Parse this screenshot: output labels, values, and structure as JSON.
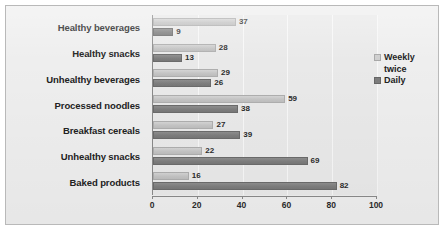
{
  "chart_data": {
    "type": "bar",
    "orientation": "horizontal",
    "title": "",
    "subtitle": "",
    "xlabel": "",
    "ylabel": "",
    "categories": [
      "Healthy beverages",
      "Healthy snacks",
      "Unhealthy beverages",
      "Processed noodles",
      "Breakfast cereals",
      "Unhealthy snacks",
      "Baked products"
    ],
    "series": [
      {
        "name": "Weekly twice",
        "color": "#c6c6c6",
        "values": [
          37,
          28,
          29,
          59,
          27,
          22,
          16
        ]
      },
      {
        "name": "Daily",
        "color": "#808080",
        "values": [
          9,
          13,
          26,
          38,
          39,
          69,
          82
        ]
      }
    ],
    "xlim": [
      0,
      100
    ],
    "xticks": [
      0,
      20,
      40,
      60,
      80,
      100
    ],
    "xtick_labels": [
      "0",
      "20",
      "40",
      "60",
      "80",
      "100"
    ],
    "grid": true,
    "grid_axis": "x",
    "legend_position": "right",
    "data_labels": true
  },
  "legend": {
    "items": [
      {
        "label": "Weekly\ntwice",
        "swatch": "legend-swatch-weekly"
      },
      {
        "label": "Daily",
        "swatch": "legend-swatch-daily"
      }
    ]
  }
}
